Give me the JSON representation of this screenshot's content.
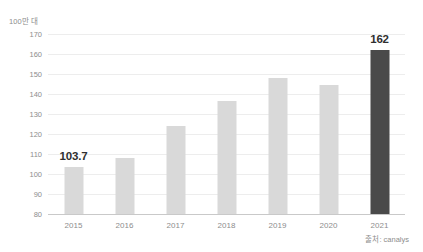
{
  "chart_data": {
    "type": "bar",
    "title": "",
    "subtitle": "",
    "xlabel": "",
    "ylabel": "",
    "unit_label": "100만 대",
    "categories": [
      "2015",
      "2016",
      "2017",
      "2018",
      "2019",
      "2020",
      "2021"
    ],
    "values": [
      103.7,
      108,
      124,
      136.5,
      148,
      144.5,
      162
    ],
    "point_labels": [
      "103.7",
      "",
      "",
      "",
      "",
      "",
      "162"
    ],
    "labeled_indices": [
      0,
      6
    ],
    "highlight_index": 6,
    "ylim": [
      80,
      170
    ],
    "ytick_step": 10,
    "ytick_labels": [
      "170",
      "160",
      "150",
      "140",
      "130",
      "120",
      "110",
      "100",
      "90",
      "80"
    ],
    "ytick_values": [
      170,
      160,
      150,
      140,
      130,
      120,
      110,
      100,
      90,
      80
    ],
    "grid": true,
    "grid_axis": "y",
    "legend": false,
    "legend_position": "none",
    "series": [
      {
        "name": "",
        "values": [
          103.7,
          108,
          124,
          136.5,
          148,
          144.5,
          162
        ]
      }
    ],
    "colors": {
      "bar": "#d9d9d9",
      "bar_highlight": "#4a4a4a",
      "gridline": "#ededed",
      "baseline": "#c9c9c9",
      "tick_text": "#8d8d8d",
      "value_text": "#2f2f2f",
      "background": "#ffffff"
    }
  },
  "footer": {
    "source": "출처: canalys"
  }
}
